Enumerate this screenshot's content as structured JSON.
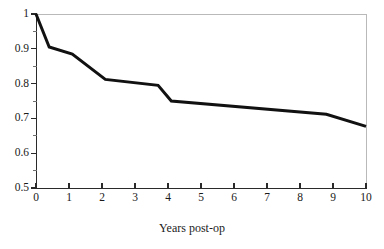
{
  "chart_data": {
    "type": "line",
    "title": "",
    "subtitle": "",
    "xlabel": "Years post-op",
    "ylabel": "",
    "xlim": [
      0,
      10
    ],
    "ylim": [
      0.5,
      1.0
    ],
    "grid": false,
    "legend": null,
    "x_ticks": [
      "0",
      "1",
      "2",
      "3",
      "4",
      "5",
      "6",
      "7",
      "8",
      "9",
      "10"
    ],
    "y_ticks": [
      "0.5",
      "0.6",
      "0.7",
      "0.8",
      "0.9",
      "1"
    ],
    "y_minor_ticks": [
      0.55,
      0.65,
      0.75,
      0.85,
      0.95
    ],
    "series": [
      {
        "name": "survival",
        "color": "#111111",
        "line_width": 3,
        "x": [
          0,
          0.4,
          1.1,
          2.1,
          3.7,
          4.1,
          8.8,
          10
        ],
        "y": [
          1.0,
          0.905,
          0.885,
          0.812,
          0.795,
          0.75,
          0.712,
          0.677
        ]
      }
    ]
  },
  "axes": {
    "x_tick_labels": [
      "0",
      "1",
      "2",
      "3",
      "4",
      "5",
      "6",
      "7",
      "8",
      "9",
      "10"
    ],
    "y_tick_labels": [
      "1",
      "0.9",
      "0.8",
      "0.7",
      "0.6",
      "0.5"
    ],
    "x_axis_title": "Years post-op"
  },
  "colors": {
    "line": "#111111",
    "axis": "#2a2a2a",
    "frame": "#b9b9b9",
    "text": "#1a1a1a",
    "background": "#ffffff"
  }
}
